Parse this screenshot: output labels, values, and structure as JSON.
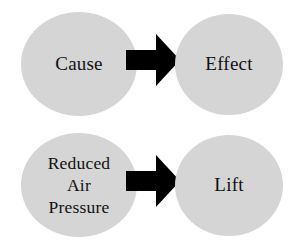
{
  "diagram": {
    "background_color": "#ffffff",
    "node_fill_color": "#d5d5d5",
    "arrow_color": "#000000",
    "text_color": "#111111",
    "rows": [
      {
        "id": "cause-effect",
        "left_node": {
          "label": "Cause",
          "multiline": false
        },
        "connector": {
          "type": "arrow-right",
          "icon": "arrow-right-icon"
        },
        "right_node": {
          "label": "Effect",
          "multiline": false
        }
      },
      {
        "id": "pressure-lift",
        "left_node": {
          "label": "Reduced\nAir\nPressure",
          "multiline": true
        },
        "connector": {
          "type": "arrow-right",
          "icon": "arrow-right-icon"
        },
        "right_node": {
          "label": "Lift",
          "multiline": false
        }
      }
    ]
  }
}
